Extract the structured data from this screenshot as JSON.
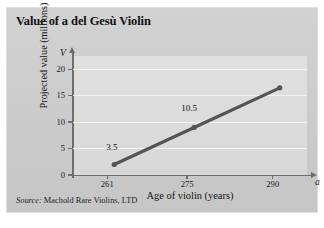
{
  "figure": {
    "title": "Value of a del Gesù Violin",
    "source_label": "Source:",
    "source_text": "Machold Rare Violins, LTD",
    "card_color": "#cfcfcf",
    "plot_color": "#dcdcdc",
    "series_color": "#545454",
    "axis_color": "#6d6d6d",
    "gridline_color": "#f4f4f4"
  },
  "chart_data": {
    "type": "line",
    "title": "Value of a del Gesù Violin",
    "xlabel": "Age of violin (years)",
    "ylabel": "Projected value (millions)",
    "x_axis_variable": "a",
    "y_axis_variable": "V",
    "x": [
      261,
      275,
      290
    ],
    "values": [
      3.5,
      10.5,
      18
    ],
    "point_labels": [
      "3.5",
      "10.5",
      ""
    ],
    "xticks": [
      261,
      275,
      290
    ],
    "xticklabels": [
      "261",
      "275",
      "290"
    ],
    "yticks": [
      0,
      5,
      10,
      15,
      20
    ],
    "yticklabels": [
      "0",
      "5",
      "10",
      "15",
      "20"
    ],
    "xlim": [
      255,
      296
    ],
    "ylim": [
      0,
      22.5
    ],
    "grid": true,
    "grid_axis": "y",
    "legend": false,
    "markers": true
  }
}
